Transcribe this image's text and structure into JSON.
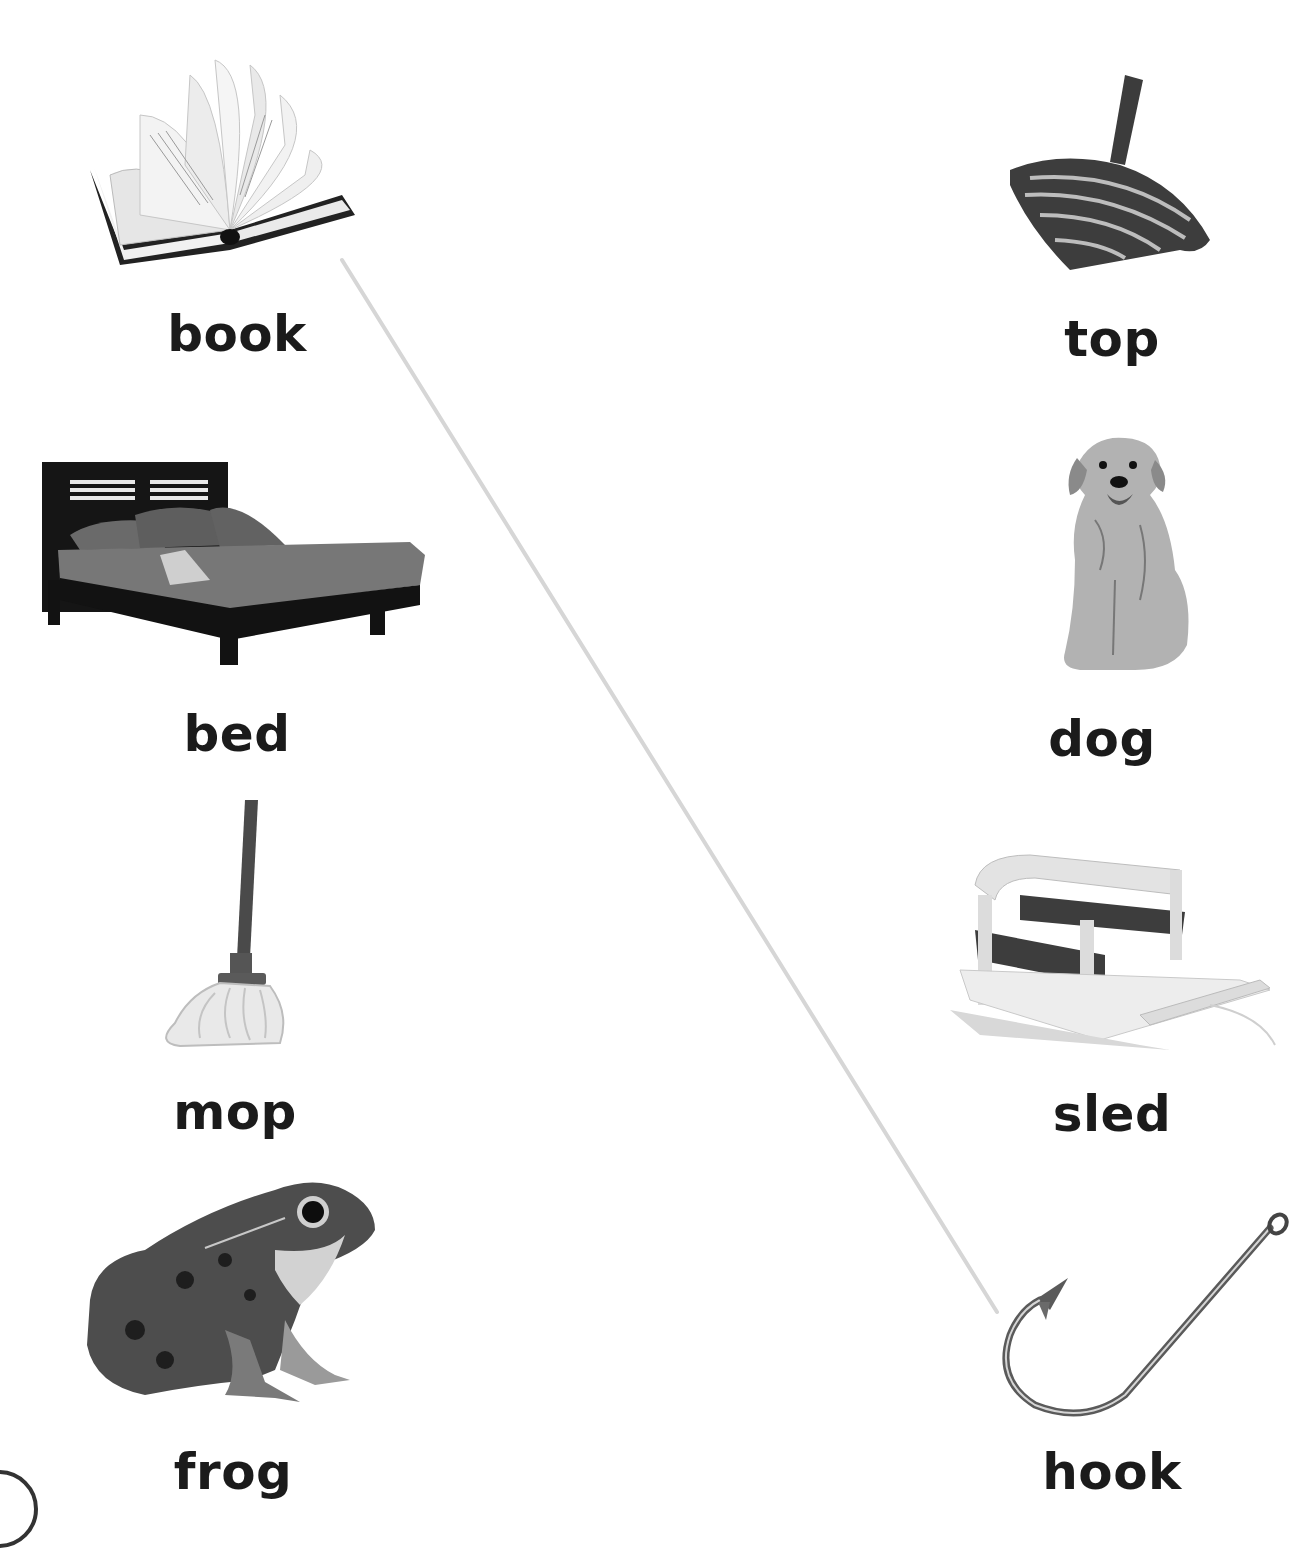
{
  "worksheet": {
    "left_column": [
      {
        "word": "book",
        "icon": "book-icon"
      },
      {
        "word": "bed",
        "icon": "bed-icon"
      },
      {
        "word": "mop",
        "icon": "mop-icon"
      },
      {
        "word": "frog",
        "icon": "frog-icon"
      }
    ],
    "right_column": [
      {
        "word": "top",
        "icon": "spinning-top-icon"
      },
      {
        "word": "dog",
        "icon": "dog-icon"
      },
      {
        "word": "sled",
        "icon": "sled-icon"
      },
      {
        "word": "hook",
        "icon": "fishing-hook-icon"
      }
    ],
    "matched_line": {
      "from": "book",
      "to": "hook",
      "color": "#d6d6d6"
    }
  }
}
